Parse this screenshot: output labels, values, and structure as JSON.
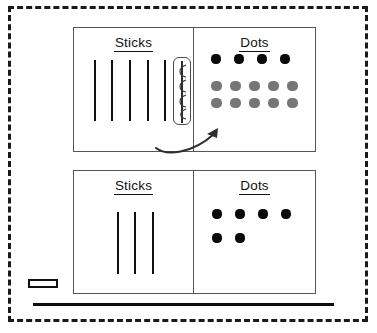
{
  "page": {
    "background_color": "#ffffff",
    "ink_color": "#101010",
    "box_border_color": "#555555",
    "gray_dot_color": "#767676",
    "dashed_border_color": "#1a1a1a"
  },
  "charts": [
    {
      "id": "top-chart",
      "name": "before-regrouping-chart",
      "sticks": {
        "heading": "Sticks",
        "loose_stick_count": 5,
        "bundled_stick_count": 1,
        "bundled_stick_note": "circled"
      },
      "dots": {
        "heading": "Dots",
        "rows": [
          {
            "color": "black",
            "count": 4
          },
          {
            "color": "gray",
            "count": 5
          },
          {
            "color": "gray",
            "count": 5
          }
        ],
        "black_count": 4,
        "gray_count": 10
      },
      "arrow": {
        "name": "regroup-arrow",
        "from": "sticks",
        "to": "dots",
        "style": "curved"
      }
    },
    {
      "id": "bottom-chart",
      "name": "after-regrouping-chart",
      "sticks": {
        "heading": "Sticks",
        "loose_stick_count": 3,
        "bundled_stick_count": 0
      },
      "dots": {
        "heading": "Dots",
        "rows": [
          {
            "color": "black",
            "count": 4
          },
          {
            "color": "black",
            "count": 2
          }
        ],
        "black_count": 6,
        "gray_count": 0
      }
    }
  ],
  "marks": {
    "corner_rectangle": "small-rectangle-marker",
    "baseline_rule": "horizontal-rule"
  }
}
